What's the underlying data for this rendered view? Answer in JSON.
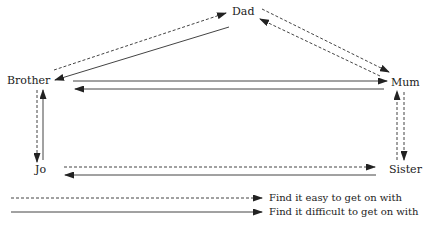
{
  "nodes": {
    "dad": {
      "label": "Dad"
    },
    "brother": {
      "label": "Brother"
    },
    "mum": {
      "label": "Mum"
    },
    "jo": {
      "label": "Jo"
    },
    "sister": {
      "label": "Sister"
    }
  },
  "edges": [
    {
      "from": "Brother",
      "to": "Dad",
      "style": "dashed",
      "meaning": "easy"
    },
    {
      "from": "Dad",
      "to": "Brother",
      "style": "solid",
      "meaning": "difficult"
    },
    {
      "from": "Dad",
      "to": "Mum",
      "style": "dashed",
      "meaning": "easy"
    },
    {
      "from": "Mum",
      "to": "Dad",
      "style": "dashed",
      "meaning": "easy"
    },
    {
      "from": "Brother",
      "to": "Mum",
      "style": "solid",
      "meaning": "difficult"
    },
    {
      "from": "Mum",
      "to": "Brother",
      "style": "solid",
      "meaning": "difficult"
    },
    {
      "from": "Brother",
      "to": "Jo",
      "style": "dashed",
      "meaning": "easy"
    },
    {
      "from": "Jo",
      "to": "Brother",
      "style": "solid",
      "meaning": "difficult"
    },
    {
      "from": "Mum",
      "to": "Sister",
      "style": "dashed",
      "meaning": "easy"
    },
    {
      "from": "Sister",
      "to": "Mum",
      "style": "dashed",
      "meaning": "easy"
    },
    {
      "from": "Jo",
      "to": "Sister",
      "style": "dashed",
      "meaning": "easy"
    },
    {
      "from": "Sister",
      "to": "Jo",
      "style": "solid",
      "meaning": "difficult"
    }
  ],
  "legend": {
    "easy": "Find it easy to get on with",
    "difficult": "Find it difficult to get on with"
  },
  "colors": {
    "line": "#333333",
    "text": "#222222",
    "background": "#ffffff"
  }
}
